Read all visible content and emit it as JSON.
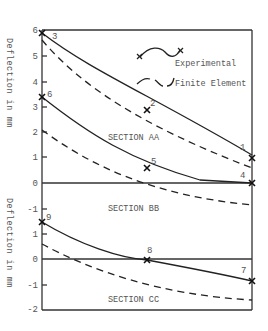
{
  "chart_data": {
    "type": "line",
    "title": "",
    "legend": {
      "position": "upper right inside",
      "entries": [
        {
          "label": "Experimental",
          "style": "solid line with x markers"
        },
        {
          "label": "Finite Element",
          "style": "dashed line"
        }
      ]
    },
    "ylabels": [
      "Deflection in mm",
      "Deflection in mm"
    ],
    "xlabel": "",
    "grid": false,
    "panels": [
      {
        "name": "SECTION AA",
        "label": "SECTION AA",
        "ylim": [
          0,
          6
        ],
        "yticks": [
          "0",
          "1",
          "2",
          "3",
          "4",
          "5",
          "6"
        ],
        "series": [
          {
            "name": "Experimental",
            "points": [
              {
                "x": 0,
                "y": 5.9,
                "label": "3"
              },
              {
                "x": 0.5,
                "y": 2.8,
                "label": "2"
              },
              {
                "x": 1,
                "y": 0.9,
                "label": "1"
              }
            ]
          },
          {
            "name": "Finite Element",
            "points": [
              {
                "x": 0,
                "y": 5.6
              },
              {
                "x": 0.5,
                "y": 2.1
              },
              {
                "x": 1,
                "y": 0.6
              }
            ]
          }
        ]
      },
      {
        "name": "SECTION AA/BB (lower curves)",
        "label": "SECTION BB",
        "ylim": [
          -1.2,
          3.5
        ],
        "yticks": [
          "0",
          "-1"
        ],
        "series": [
          {
            "name": "Experimental",
            "points": [
              {
                "x": 0,
                "y": 3.4,
                "label": "6"
              },
              {
                "x": 0.5,
                "y": 0.6,
                "label": "5"
              },
              {
                "x": 1,
                "y": 0.0,
                "label": "4"
              }
            ]
          },
          {
            "name": "Finite Element",
            "points": [
              {
                "x": 0,
                "y": 2.1
              },
              {
                "x": 0.4,
                "y": 0.0
              },
              {
                "x": 1,
                "y": -0.9
              }
            ]
          }
        ]
      },
      {
        "name": "SECTION CC",
        "label": "SECTION CC",
        "ylim": [
          -2,
          1.5
        ],
        "yticks": [
          "1",
          "0",
          "-1",
          "-2"
        ],
        "series": [
          {
            "name": "Experimental",
            "points": [
              {
                "x": 0,
                "y": 1.5,
                "label": "9"
              },
              {
                "x": 0.5,
                "y": 0.0,
                "label": "8"
              },
              {
                "x": 1,
                "y": -0.85,
                "label": "7"
              }
            ]
          },
          {
            "name": "Finite Element",
            "points": [
              {
                "x": 0,
                "y": 0.6
              },
              {
                "x": 0.15,
                "y": 0.0
              },
              {
                "x": 1,
                "y": -1.65
              }
            ]
          }
        ]
      }
    ]
  },
  "labels": {
    "legend_experimental": "Experimental",
    "legend_fe": "Finite Element",
    "ylabel_top": "Deflection in mm",
    "ylabel_bottom": "Deflection in mm",
    "section_aa": "SECTION AA",
    "section_bb": "SECTION BB",
    "section_cc": "SECTION CC"
  },
  "colors": {
    "line": "#222222",
    "text": "#555555",
    "axis": "#333333"
  }
}
